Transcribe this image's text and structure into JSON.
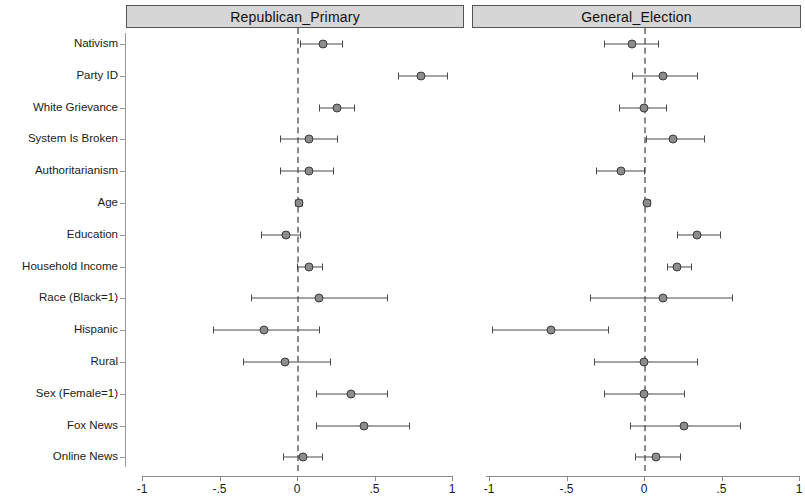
{
  "figure": {
    "type": "coefficient-plot",
    "panels": [
      {
        "id": "republican_primary",
        "title": "Republican_Primary"
      },
      {
        "id": "general_election",
        "title": "General_Election"
      }
    ],
    "outcome_labels": [
      "Nativism",
      "Party ID",
      "White Grievance",
      "System Is Broken",
      "Authoritarianism",
      "Age",
      "Education",
      "Household Income",
      "Race (Black=1)",
      "Hispanic",
      "Rural",
      "Sex (Female=1)",
      "Fox News",
      "Online News"
    ],
    "x_tick_labels": [
      "-1",
      "-.5",
      "0",
      ".5",
      "1"
    ],
    "colors": {
      "header_fill": "#d6d6d6",
      "header_border": "#555555",
      "marker_fill": "#8c8c8c",
      "marker_edge": "#3a3a3a",
      "ci_line": "#4a4a4a",
      "zero_line": "#8a8a8a"
    }
  },
  "chart_data": {
    "type": "scatter",
    "title": "",
    "xlabel": "",
    "ylabel": "",
    "xlim": [
      -1,
      1
    ],
    "xticks": [
      -1,
      -0.5,
      0,
      0.5,
      1
    ],
    "xticklabels": [
      "-1",
      "-.5",
      "0",
      ".5",
      "1"
    ],
    "grid": false,
    "legend": "none",
    "reference_line": 0,
    "categories": [
      "Nativism",
      "Party ID",
      "White Grievance",
      "System Is Broken",
      "Authoritarianism",
      "Age",
      "Education",
      "Household Income",
      "Race (Black=1)",
      "Hispanic",
      "Rural",
      "Sex (Female=1)",
      "Fox News",
      "Online News"
    ],
    "panels": [
      {
        "name": "Republican_Primary",
        "estimates": [
          0.17,
          0.8,
          0.26,
          0.08,
          0.08,
          0.01,
          -0.07,
          0.08,
          0.14,
          -0.21,
          -0.08,
          0.35,
          0.43,
          0.04
        ],
        "ci_low": [
          0.02,
          0.65,
          0.14,
          -0.11,
          -0.11,
          -0.01,
          -0.23,
          0.0,
          -0.3,
          -0.54,
          -0.35,
          0.12,
          0.12,
          -0.09
        ],
        "ci_high": [
          0.29,
          0.97,
          0.37,
          0.26,
          0.23,
          0.03,
          0.02,
          0.16,
          0.58,
          0.14,
          0.21,
          0.58,
          0.72,
          0.16
        ]
      },
      {
        "name": "General_Election",
        "estimates": [
          -0.08,
          0.12,
          0.0,
          0.19,
          -0.15,
          0.02,
          0.34,
          0.21,
          0.12,
          -0.6,
          0.0,
          0.0,
          0.26,
          0.08
        ],
        "ci_low": [
          -0.26,
          -0.08,
          -0.16,
          0.01,
          -0.31,
          0.0,
          0.21,
          0.15,
          -0.35,
          -0.98,
          -0.32,
          -0.26,
          -0.09,
          -0.06
        ],
        "ci_high": [
          0.09,
          0.34,
          0.14,
          0.39,
          0.0,
          0.04,
          0.49,
          0.3,
          0.57,
          -0.23,
          0.34,
          0.26,
          0.62,
          0.23
        ]
      }
    ]
  }
}
